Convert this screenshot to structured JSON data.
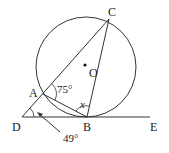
{
  "diagram": {
    "points": {
      "A": "A",
      "B": "B",
      "C": "C",
      "D": "D",
      "E": "E",
      "O": "O"
    },
    "angles": {
      "angle_CAB": "75°",
      "angle_ADB": "49°",
      "angle_ABC": "x"
    },
    "colors": {
      "stroke": "#333333",
      "background": "#ffffff"
    }
  }
}
